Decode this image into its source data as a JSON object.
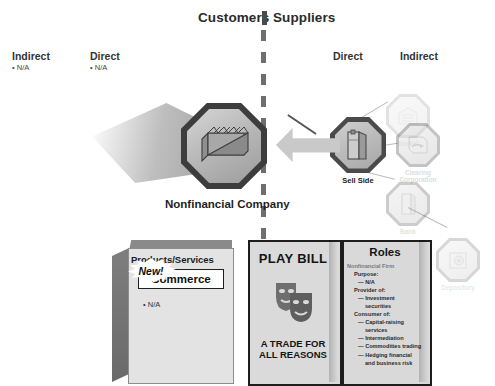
{
  "diagram": {
    "title_left": "Customers",
    "title_right": "Suppliers",
    "left_columns": [
      {
        "label": "Indirect",
        "bullet": "• N/A"
      },
      {
        "label": "Direct",
        "bullet": "• N/A"
      }
    ],
    "right_columns": [
      {
        "label": "Direct"
      },
      {
        "label": "Indirect"
      }
    ],
    "center_node": {
      "label": "Nonfinancial Company",
      "icon": "factory-icon"
    },
    "sell_side_node": {
      "label": "Sell Side",
      "icon": "office-tower-icon"
    },
    "faded_nodes": [
      {
        "label": "Market",
        "icon": "market-icon"
      },
      {
        "label": "Clearing\nCorporation",
        "label_line1": "Clearing",
        "label_line2": "Corporation",
        "icon": "clearing-icon"
      },
      {
        "label": "Bank",
        "icon": "bank-icon"
      },
      {
        "label": "Depository",
        "icon": "vault-icon"
      }
    ],
    "products_box": {
      "title": "Products/Services",
      "badge": "New!",
      "highlight": "Commerce",
      "bullet": "• N/A"
    },
    "playbill": {
      "title": "PLAY BILL",
      "icon": "theatre-masks-icon",
      "footer_line1": "A TRADE FOR",
      "footer_line2": "ALL REASONS"
    },
    "roles": {
      "title": "Roles",
      "subject": "Nonfinancial Firm",
      "sections": [
        {
          "heading": "Purpose:",
          "items": [
            "— N/A"
          ]
        },
        {
          "heading": "Provider of:",
          "items": [
            "— Investment",
            "securities"
          ]
        },
        {
          "heading": "Consumer of:",
          "items": [
            "— Capital-raising",
            "services",
            "— Intermediation",
            "— Commodities trading",
            "— Hedging financial",
            "and business risk"
          ]
        }
      ]
    },
    "colors": {
      "ink": "#1d1d1d",
      "divider": "#6e6e6e",
      "panel_fill": "#d9d9d9",
      "node_ring": "#3d3d3d",
      "faded": "#8f8f8f"
    }
  }
}
